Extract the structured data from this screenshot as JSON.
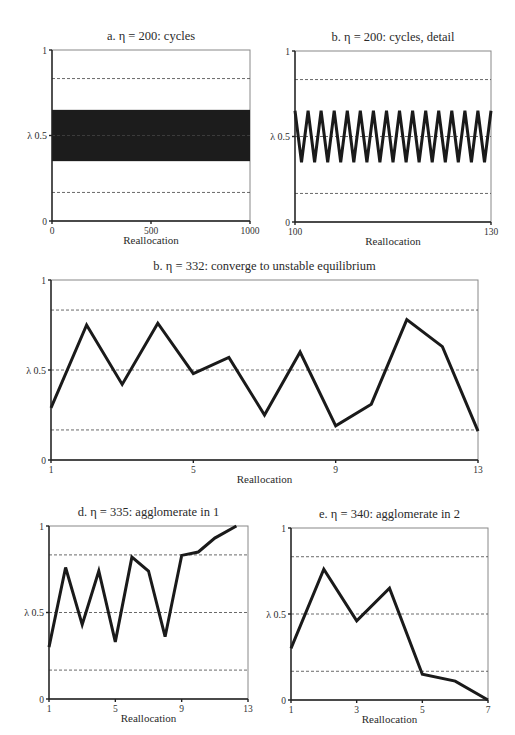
{
  "chart_data": [
    {
      "id": "a",
      "type": "area",
      "title": "a.  η = 200: cycles",
      "xlabel": "Reallocation",
      "ylabel": "λ",
      "xlim": [
        0,
        1000
      ],
      "ylim": [
        0,
        1
      ],
      "xticks": [
        "0",
        "500",
        "1000"
      ],
      "yticks": [
        "0",
        "0.5",
        "1"
      ],
      "reference_lines": [
        0.167,
        0.5,
        0.833
      ],
      "band": {
        "low": 0.35,
        "high": 0.65,
        "description": "rapid oscillation between 0.35 and 0.65 across all 1000 reallocations"
      },
      "frame": {
        "left": 52,
        "right": 250,
        "top": 50,
        "bottom": 221
      }
    },
    {
      "id": "b",
      "type": "line",
      "title": "b.  η = 200: cycles, detail",
      "xlabel": "Reallocation",
      "ylabel": "λ",
      "xlim": [
        100,
        130
      ],
      "ylim": [
        0,
        1
      ],
      "xticks": [
        "100",
        "130"
      ],
      "yticks": [
        "0",
        "0.5",
        "1"
      ],
      "reference_lines": [
        0.167,
        0.5,
        0.833
      ],
      "cycle": {
        "low": 0.35,
        "high": 0.65,
        "period": 2,
        "start_high": true
      },
      "frame": {
        "left": 295,
        "right": 491,
        "top": 51,
        "bottom": 222
      }
    },
    {
      "id": "c",
      "type": "line",
      "title": "b.  η = 332: converge to unstable equilibrium",
      "xlabel": "Reallocation",
      "ylabel": "λ",
      "xlim": [
        1,
        13
      ],
      "ylim": [
        0,
        1
      ],
      "xticks": [
        "1",
        "5",
        "9",
        "13"
      ],
      "yticks": [
        "0",
        "0.5",
        "1"
      ],
      "reference_lines": [
        0.167,
        0.5,
        0.833
      ],
      "x": [
        1,
        2,
        3,
        4,
        5,
        6,
        7,
        8,
        9,
        10,
        11,
        12,
        13
      ],
      "values": [
        0.29,
        0.75,
        0.42,
        0.76,
        0.48,
        0.57,
        0.25,
        0.6,
        0.19,
        0.31,
        0.78,
        0.63,
        0.16
      ],
      "frame": {
        "left": 51,
        "right": 478,
        "top": 280,
        "bottom": 460
      }
    },
    {
      "id": "d",
      "type": "line",
      "title": "d.  η = 335: agglomerate in 1",
      "xlabel": "Reallocation",
      "ylabel": "λ",
      "xlim": [
        1,
        13
      ],
      "ylim": [
        0,
        1
      ],
      "xticks": [
        "1",
        "5",
        "9",
        "13"
      ],
      "yticks": [
        "0",
        "0.5",
        "1"
      ],
      "reference_lines": [
        0.167,
        0.5,
        0.833
      ],
      "x": [
        1,
        2,
        3,
        4,
        5,
        6,
        7,
        8,
        9,
        10,
        11,
        12.3
      ],
      "values": [
        0.3,
        0.76,
        0.43,
        0.74,
        0.33,
        0.82,
        0.74,
        0.36,
        0.83,
        0.85,
        0.93,
        1.0
      ],
      "frame": {
        "left": 49,
        "right": 248,
        "top": 526,
        "bottom": 699
      }
    },
    {
      "id": "e",
      "type": "line",
      "title": "e.  η = 340: agglomerate in 2",
      "xlabel": "Reallocation",
      "ylabel": "λ",
      "xlim": [
        1,
        7
      ],
      "ylim": [
        0,
        1
      ],
      "xticks": [
        "1",
        "3",
        "5",
        "7"
      ],
      "yticks": [
        "0",
        "0.5",
        "1"
      ],
      "reference_lines": [
        0.167,
        0.5,
        0.833
      ],
      "x": [
        1,
        2,
        3,
        4,
        5,
        6,
        7
      ],
      "values": [
        0.3,
        0.76,
        0.46,
        0.65,
        0.15,
        0.11,
        0.0
      ],
      "frame": {
        "left": 291,
        "right": 488,
        "top": 528,
        "bottom": 700
      }
    }
  ],
  "labels": {
    "a_title": "a.  η = 200: cycles",
    "b_title": "b.  η = 200: cycles, detail",
    "c_title": "b.  η = 332: converge to unstable equilibrium",
    "d_title": "d.  η = 335: agglomerate in 1",
    "e_title": "e.  η = 340: agglomerate in 2",
    "xlabel": "Reallocation",
    "ylabel_prefix": "λ"
  },
  "colors": {
    "line": "#1a1a1a",
    "frame": "#888888",
    "axis": "#222222",
    "reference": "#444444",
    "band": "#1c1c1c",
    "band_center": "#e8e8e8"
  }
}
